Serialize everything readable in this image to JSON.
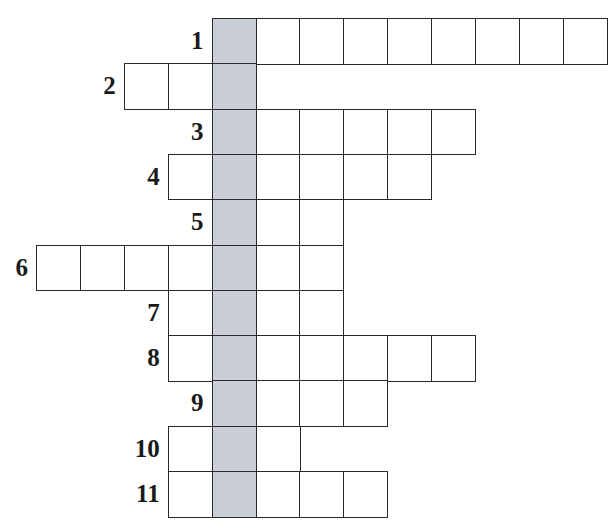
{
  "puzzle": {
    "type": "crossword",
    "key_column": 4,
    "key_column_color": "#c9cdd5",
    "grid_origin": {
      "x": 36,
      "y": 18
    },
    "cell_width": 43.9,
    "cell_height": 45.3,
    "rows": [
      {
        "number": "1",
        "start_col": 4,
        "length": 9
      },
      {
        "number": "2",
        "start_col": 2,
        "length": 3
      },
      {
        "number": "3",
        "start_col": 4,
        "length": 6
      },
      {
        "number": "4",
        "start_col": 3,
        "length": 6
      },
      {
        "number": "5",
        "start_col": 4,
        "length": 3
      },
      {
        "number": "6",
        "start_col": 0,
        "length": 7
      },
      {
        "number": "7",
        "start_col": 3,
        "length": 4
      },
      {
        "number": "8",
        "start_col": 3,
        "length": 7
      },
      {
        "number": "9",
        "start_col": 4,
        "length": 4
      },
      {
        "number": "10",
        "start_col": 3,
        "length": 3
      },
      {
        "number": "11",
        "start_col": 3,
        "length": 5
      }
    ]
  }
}
